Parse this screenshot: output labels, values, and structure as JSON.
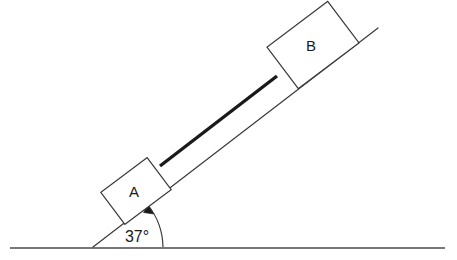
{
  "diagram": {
    "type": "inclined-plane-two-blocks",
    "canvas": {
      "width": 457,
      "height": 260,
      "background": "#ffffff"
    },
    "colors": {
      "line": "#3a3a3a",
      "ground": "#4a4a4a",
      "rod": "#1a1a1a",
      "block_fill": "#ffffff",
      "block_stroke": "#3a3a3a",
      "text": "#1a1a1a"
    },
    "ground": {
      "label": "ground-line",
      "x1": 10,
      "y1": 248,
      "x2": 445,
      "y2": 248,
      "stroke_width": 1.6
    },
    "incline": {
      "label": "incline-surface",
      "x1": 93,
      "y1": 247,
      "x2": 378,
      "y2": 28,
      "stroke_width": 1.2
    },
    "angle": {
      "value": 37,
      "unit": "degrees",
      "label": "37°",
      "vertex_x": 93,
      "vertex_y": 247,
      "label_x": 137,
      "label_y": 242,
      "arc_radius": 70,
      "arc_path": "M 163 247 A 70 70 0 0 0 148 205",
      "arrow_path": "M 148 205 L 152 213 L 143 212 Z"
    },
    "blocks": [
      {
        "id": "block-a",
        "label": "A",
        "center_x": 136,
        "center_y": 191,
        "width": 58,
        "height": 40,
        "rotation": -37,
        "label_x": 134,
        "label_y": 197
      },
      {
        "id": "block-b",
        "label": "B",
        "center_x": 313,
        "center_y": 45,
        "width": 76,
        "height": 52,
        "rotation": -37,
        "label_x": 311,
        "label_y": 51
      }
    ],
    "rod": {
      "id": "connecting-rod",
      "label": "rod",
      "x1": 160,
      "y1": 166,
      "x2": 277,
      "y2": 76,
      "stroke_width": 3.4
    }
  }
}
